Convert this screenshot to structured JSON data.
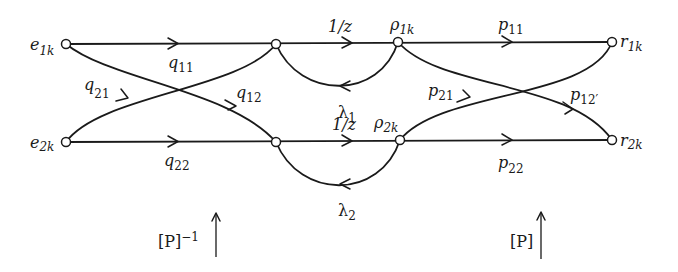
{
  "diagram": {
    "type": "signal-flow-graph",
    "nodes": {
      "e1": {
        "base": "e",
        "sub": "1k"
      },
      "e2": {
        "base": "e",
        "sub": "2k"
      },
      "rho1": {
        "base": "ρ",
        "sub": "1k"
      },
      "rho2": {
        "base": "ρ",
        "sub": "2k"
      },
      "r1": {
        "base": "r",
        "sub": "1k"
      },
      "r2": {
        "base": "r",
        "sub": "2k"
      }
    },
    "edges": {
      "q11": {
        "base": "q",
        "sub": "11"
      },
      "q12": {
        "base": "q",
        "sub": "12"
      },
      "q21": {
        "base": "q",
        "sub": "21"
      },
      "q22": {
        "base": "q",
        "sub": "22"
      },
      "delay1": "1/z",
      "delay2": "1/z",
      "lambda1": {
        "base": "λ",
        "sub": "1"
      },
      "lambda2": {
        "base": "λ",
        "sub": "2"
      },
      "p11": {
        "base": "p",
        "sub": "11"
      },
      "p12": {
        "base": "p",
        "sub": "12′"
      },
      "p21": {
        "base": "p",
        "sub": "21"
      },
      "p22": {
        "base": "p",
        "sub": "22"
      }
    },
    "transforms": {
      "left": {
        "text": "[P]",
        "sup": "−1"
      },
      "right": {
        "text": "[P]"
      }
    }
  }
}
